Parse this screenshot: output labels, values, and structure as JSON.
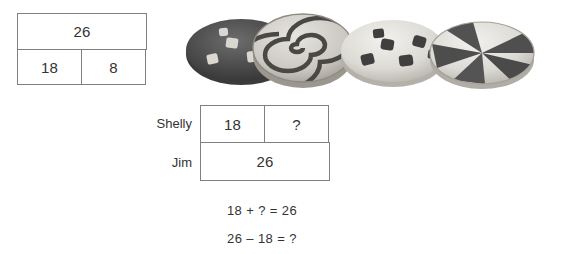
{
  "whole_part_model": {
    "name": "whole-part bar model",
    "whole": "26",
    "parts": [
      "18",
      "8"
    ]
  },
  "comparison_model": {
    "name": "comparison bar model",
    "rows": [
      {
        "label": "Shelly",
        "cells": [
          "18",
          "?"
        ]
      },
      {
        "label": "Jim",
        "cells": [
          "26"
        ]
      }
    ]
  },
  "equations": [
    "18 + ? = 26",
    "26 – 18 = ?"
  ],
  "illustration": {
    "name": "cookies",
    "items": [
      {
        "name": "chocolate-cookie-with-white-chips"
      },
      {
        "name": "spiral-swirl-cookie"
      },
      {
        "name": "sugar-cookie-with-dark-chips"
      },
      {
        "name": "pinwheel-cookie"
      }
    ]
  },
  "colors": {
    "border": "#808080",
    "text": "#333333",
    "background": "#ffffff",
    "cookie_dark": "#4a4a4a",
    "cookie_light": "#d8d8d4"
  }
}
